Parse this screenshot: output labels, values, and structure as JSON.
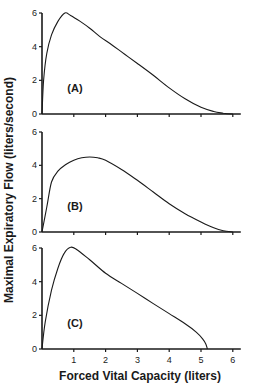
{
  "chart_data": {
    "type": "line",
    "title": "",
    "xlabel": "Forced Vital Capacity (liters)",
    "ylabel": "Maximal Expiratory Flow (liters/second)",
    "xlim": [
      0,
      6
    ],
    "x_ticks": [
      1,
      2,
      3,
      4,
      5,
      6
    ],
    "ylim": [
      0,
      6
    ],
    "y_ticks": [
      0,
      2,
      4,
      6
    ],
    "grid": false,
    "legend": null,
    "panels": [
      {
        "label": "(A)",
        "series": [
          {
            "name": "A",
            "x": [
              0,
              0.05,
              0.15,
              0.3,
              0.5,
              0.72,
              0.9,
              1.2,
              1.5,
              1.82,
              2.2,
              2.6,
              3.0,
              3.5,
              4.0,
              4.5,
              5.0,
              5.4,
              5.7,
              6.0
            ],
            "y": [
              0,
              2.0,
              3.6,
              4.7,
              5.5,
              6.0,
              5.85,
              5.5,
              5.1,
              4.6,
              4.1,
              3.55,
              3.0,
              2.3,
              1.55,
              0.9,
              0.4,
              0.15,
              0.05,
              0
            ]
          }
        ]
      },
      {
        "label": "(B)",
        "series": [
          {
            "name": "B",
            "x": [
              0,
              0.15,
              0.3,
              0.5,
              0.75,
              1.0,
              1.25,
              1.5,
              1.75,
              2.0,
              2.5,
              3.0,
              3.5,
              4.0,
              4.5,
              5.0,
              5.4,
              5.7,
              6.0
            ],
            "y": [
              0,
              1.5,
              3.0,
              3.65,
              4.05,
              4.3,
              4.45,
              4.5,
              4.45,
              4.3,
              3.75,
              3.1,
              2.4,
              1.7,
              1.1,
              0.6,
              0.25,
              0.07,
              0
            ]
          }
        ]
      },
      {
        "label": "(C)",
        "series": [
          {
            "name": "C",
            "x": [
              0,
              0.1,
              0.3,
              0.5,
              0.7,
              0.9,
              1.1,
              1.5,
              2.0,
              2.5,
              3.0,
              3.5,
              4.0,
              4.5,
              4.85,
              5.05,
              5.15,
              5.2
            ],
            "y": [
              0,
              1.6,
              3.5,
              4.8,
              5.7,
              6.05,
              5.9,
              5.3,
              4.5,
              3.9,
              3.3,
              2.7,
              2.1,
              1.5,
              1.0,
              0.6,
              0.3,
              0
            ]
          }
        ]
      }
    ]
  }
}
